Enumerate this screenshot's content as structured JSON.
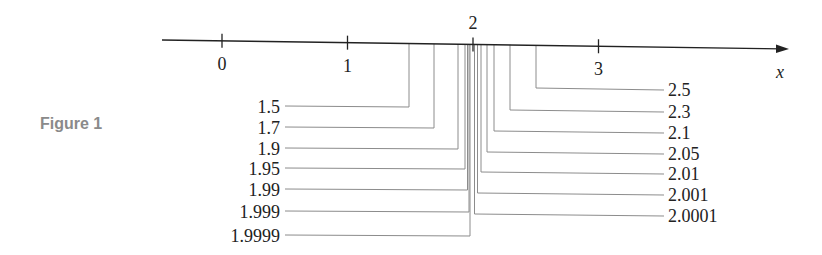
{
  "caption": "Figure 1",
  "axis": {
    "variable": "x",
    "ticks": [
      {
        "value": 0,
        "label": "0"
      },
      {
        "value": 1,
        "label": "1"
      },
      {
        "value": 2,
        "label": "2"
      },
      {
        "value": 3,
        "label": "3"
      }
    ]
  },
  "left_values": [
    {
      "value": 1.5,
      "label": "1.5"
    },
    {
      "value": 1.7,
      "label": "1.7"
    },
    {
      "value": 1.9,
      "label": "1.9"
    },
    {
      "value": 1.95,
      "label": "1.95"
    },
    {
      "value": 1.99,
      "label": "1.99"
    },
    {
      "value": 1.999,
      "label": "1.999"
    },
    {
      "value": 1.9999,
      "label": "1.9999"
    }
  ],
  "right_values": [
    {
      "value": 2.5,
      "label": "2.5"
    },
    {
      "value": 2.3,
      "label": "2.3"
    },
    {
      "value": 2.1,
      "label": "2.1"
    },
    {
      "value": 2.05,
      "label": "2.05"
    },
    {
      "value": 2.01,
      "label": "2.01"
    },
    {
      "value": 2.001,
      "label": "2.001"
    },
    {
      "value": 2.0001,
      "label": "2.0001"
    }
  ],
  "colors": {
    "axis": "#222222",
    "leader": "#8c8c8c",
    "text": "#222222",
    "caption": "#8a8a8a"
  }
}
